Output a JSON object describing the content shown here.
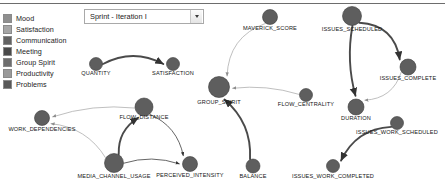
{
  "window": {
    "background": "#ffffff",
    "divider_color": "#6d6d6d"
  },
  "legend": {
    "title": "",
    "items": [
      {
        "label": "Mood",
        "color": "#8f8f8f"
      },
      {
        "label": "Satisfaction",
        "color": "#a6a6a6"
      },
      {
        "label": "Communication",
        "color": "#636363"
      },
      {
        "label": "Meeting",
        "color": "#4a4a4a"
      },
      {
        "label": "Group Spirit",
        "color": "#6e6e6e"
      },
      {
        "label": "Productivity",
        "color": "#9a9a9a"
      },
      {
        "label": "Problems",
        "color": "#585858"
      }
    ]
  },
  "sprint_selector": {
    "value": "Sprint - Iteration I",
    "placeholder": "Sprint - Iteration I",
    "arrow_icon": "chevron-down-icon"
  },
  "graph": {
    "node_fill": "#5e5e5e",
    "node_stroke": "#3a3a3a",
    "edge_color": "#4a4a4a",
    "edge_color_light": "#b4b4b4",
    "nodes": [
      {
        "id": "QUANTITY",
        "label": "QUANTITY",
        "x": 96,
        "y": 64,
        "r": 6.5,
        "lx": 96,
        "ly": 74
      },
      {
        "id": "SATISFACTION",
        "label": "SATISFACTION",
        "x": 173,
        "y": 64,
        "r": 6.5,
        "lx": 173,
        "ly": 74
      },
      {
        "id": "MAVERICK_SCORE",
        "label": "MAVERICK_SCORE",
        "x": 270,
        "y": 17,
        "r": 7.5,
        "lx": 270,
        "ly": 29
      },
      {
        "id": "ISSUES_SCHEDULED",
        "label": "ISSUES_SCHEDULED",
        "x": 352,
        "y": 16,
        "r": 9.5,
        "lx": 352,
        "ly": 30
      },
      {
        "id": "ISSUES_COMPLETE",
        "label": "ISSUES_COMPLETE",
        "x": 408,
        "y": 67,
        "r": 8.0,
        "lx": 408,
        "ly": 79
      },
      {
        "id": "GROUP_SPIRIT",
        "label": "GROUP_SPIRIT",
        "x": 219,
        "y": 87,
        "r": 10.5,
        "lx": 219,
        "ly": 103
      },
      {
        "id": "FLOW_CENTRALITY",
        "label": "FLOW_CENTRALITY",
        "x": 306,
        "y": 95,
        "r": 6.5,
        "lx": 306,
        "ly": 105
      },
      {
        "id": "DURATION",
        "label": "DURATION",
        "x": 356,
        "y": 107,
        "r": 8.0,
        "lx": 356,
        "ly": 119
      },
      {
        "id": "ISSUES_WORK_SCHEDULED",
        "label": "ISSUES_WORK_SCHEDULED",
        "x": 397,
        "y": 123,
        "r": 6.5,
        "lx": 397,
        "ly": 133
      },
      {
        "id": "ISSUES_WORK_COMPLETED",
        "label": "ISSUES_WORK_COMPLETED",
        "x": 333,
        "y": 166,
        "r": 6.5,
        "lx": 333,
        "ly": 177
      },
      {
        "id": "BALANCE",
        "label": "BALANCE",
        "x": 253,
        "y": 166,
        "r": 7.0,
        "lx": 253,
        "ly": 177
      },
      {
        "id": "PERCEIVED_INTENSITY",
        "label": "PERCEIVED_INTENSITY",
        "x": 190,
        "y": 164,
        "r": 7.5,
        "lx": 190,
        "ly": 176
      },
      {
        "id": "MEDIA_CHANNEL_USAGE",
        "label": "MEDIA_CHANNEL_USAGE",
        "x": 114,
        "y": 163,
        "r": 9.5,
        "lx": 114,
        "ly": 177
      },
      {
        "id": "FLOW_DISTANCE",
        "label": "FLOW_DISTANCE",
        "x": 144,
        "y": 107,
        "r": 9.0,
        "lx": 144,
        "ly": 118
      },
      {
        "id": "WORK_DEPENDENCIES",
        "label": "WORK_DEPENDENCIES",
        "x": 42,
        "y": 118,
        "r": 7.5,
        "lx": 42,
        "ly": 130
      }
    ],
    "edges": [
      {
        "from": "QUANTITY",
        "to": "SATISFACTION",
        "weight": "thick",
        "tone": "dark",
        "curve": -16
      },
      {
        "from": "MAVERICK_SCORE",
        "to": "GROUP_SPIRIT",
        "weight": "thin",
        "tone": "light",
        "curve": 22
      },
      {
        "from": "FLOW_CENTRALITY",
        "to": "GROUP_SPIRIT",
        "weight": "thin",
        "tone": "light",
        "curve": 7
      },
      {
        "from": "BALANCE",
        "to": "GROUP_SPIRIT",
        "weight": "thick",
        "tone": "dark",
        "curve": 16
      },
      {
        "from": "ISSUES_SCHEDULED",
        "to": "ISSUES_COMPLETE",
        "weight": "thick",
        "tone": "dark",
        "curve": -22
      },
      {
        "from": "ISSUES_SCHEDULED",
        "to": "DURATION",
        "weight": "thick",
        "tone": "dark",
        "curve": 8
      },
      {
        "from": "ISSUES_COMPLETE",
        "to": "DURATION",
        "weight": "thin",
        "tone": "light",
        "curve": -16
      },
      {
        "from": "ISSUES_WORK_SCHEDULED",
        "to": "ISSUES_WORK_COMPLETED",
        "weight": "thick",
        "tone": "dark",
        "curve": 18
      },
      {
        "from": "MEDIA_CHANNEL_USAGE",
        "to": "FLOW_DISTANCE",
        "weight": "thick",
        "tone": "dark",
        "curve": -12
      },
      {
        "from": "MEDIA_CHANNEL_USAGE",
        "to": "PERCEIVED_INTENSITY",
        "weight": "thin",
        "tone": "dark",
        "curve": -9
      },
      {
        "from": "MEDIA_CHANNEL_USAGE",
        "to": "WORK_DEPENDENCIES",
        "weight": "thin",
        "tone": "light",
        "curve": 16
      },
      {
        "from": "FLOW_DISTANCE",
        "to": "PERCEIVED_INTENSITY",
        "weight": "thin",
        "tone": "dark",
        "curve": -14
      },
      {
        "from": "FLOW_DISTANCE",
        "to": "WORK_DEPENDENCIES",
        "weight": "thin",
        "tone": "light",
        "curve": 9
      }
    ]
  }
}
